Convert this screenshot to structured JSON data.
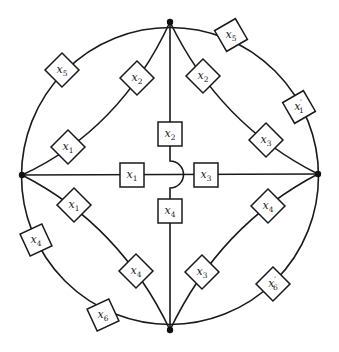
{
  "diagram": {
    "type": "circuit-network",
    "nodes": [
      {
        "id": "top",
        "x": 170,
        "y": 22
      },
      {
        "id": "left",
        "x": 22,
        "y": 175
      },
      {
        "id": "right",
        "x": 318,
        "y": 174
      },
      {
        "id": "bottom",
        "x": 170,
        "y": 330
      }
    ],
    "boxes": [
      {
        "id": "b1",
        "var": "x",
        "sub": "5",
        "prime": "",
        "x": 62,
        "y": 70,
        "rot": 45,
        "edge": "outer top-left arc"
      },
      {
        "id": "b2",
        "var": "x",
        "sub": "2",
        "prime": "",
        "x": 137,
        "y": 78,
        "rot": 45,
        "edge": "inner top-left curve"
      },
      {
        "id": "b3",
        "var": "x",
        "sub": "1",
        "prime": "",
        "x": 68,
        "y": 147,
        "rot": 45,
        "edge": "inner top-left curve"
      },
      {
        "id": "b4",
        "var": "x",
        "sub": "5",
        "prime": "",
        "x": 231,
        "y": 35,
        "rot": 30,
        "edge": "outer top-right arc"
      },
      {
        "id": "b5",
        "var": "x",
        "sub": "1",
        "prime": "′",
        "x": 299,
        "y": 107,
        "rot": 30,
        "edge": "outer top-right arc"
      },
      {
        "id": "b6",
        "var": "x",
        "sub": "2",
        "prime": "",
        "x": 203,
        "y": 76,
        "rot": 45,
        "edge": "inner top-right curve"
      },
      {
        "id": "b7",
        "var": "x",
        "sub": "3",
        "prime": "",
        "x": 266,
        "y": 140,
        "rot": 45,
        "edge": "inner top-right curve"
      },
      {
        "id": "b8",
        "var": "x",
        "sub": "1",
        "prime": "",
        "x": 74,
        "y": 205,
        "rot": 45,
        "edge": "inner bottom-left curve"
      },
      {
        "id": "b9",
        "var": "x",
        "sub": "4",
        "prime": "",
        "x": 136,
        "y": 271,
        "rot": 45,
        "edge": "inner bottom-left curve"
      },
      {
        "id": "b10",
        "var": "x",
        "sub": "4",
        "prime": "",
        "x": 36,
        "y": 240,
        "rot": 25,
        "edge": "outer bottom-left arc"
      },
      {
        "id": "b11",
        "var": "x",
        "sub": "6",
        "prime": "",
        "x": 103,
        "y": 315,
        "rot": 25,
        "edge": "outer bottom-left arc"
      },
      {
        "id": "b12",
        "var": "x",
        "sub": "4",
        "prime": "",
        "x": 268,
        "y": 206,
        "rot": 45,
        "edge": "inner bottom-right curve"
      },
      {
        "id": "b13",
        "var": "x",
        "sub": "3",
        "prime": "",
        "x": 202,
        "y": 272,
        "rot": 45,
        "edge": "inner bottom-right curve"
      },
      {
        "id": "b14",
        "var": "x",
        "sub": "6",
        "prime": "′",
        "x": 273,
        "y": 284,
        "rot": 45,
        "edge": "outer bottom-right arc"
      },
      {
        "id": "c1",
        "var": "x",
        "sub": "1",
        "prime": "",
        "x": 132,
        "y": 175,
        "rot": 0,
        "edge": "center horizontal"
      },
      {
        "id": "c3",
        "var": "x",
        "sub": "3",
        "prime": "",
        "x": 206,
        "y": 175,
        "rot": 0,
        "edge": "center horizontal"
      },
      {
        "id": "c2",
        "var": "x",
        "sub": "2",
        "prime": "",
        "x": 170,
        "y": 134,
        "rot": 0,
        "edge": "center vertical"
      },
      {
        "id": "c4",
        "var": "x",
        "sub": "4",
        "prime": "",
        "x": 170,
        "y": 211,
        "rot": 0,
        "edge": "center vertical"
      }
    ],
    "crossover": {
      "description": "vertical wire hops over horizontal wire at center",
      "x": 170,
      "y": 175
    }
  }
}
